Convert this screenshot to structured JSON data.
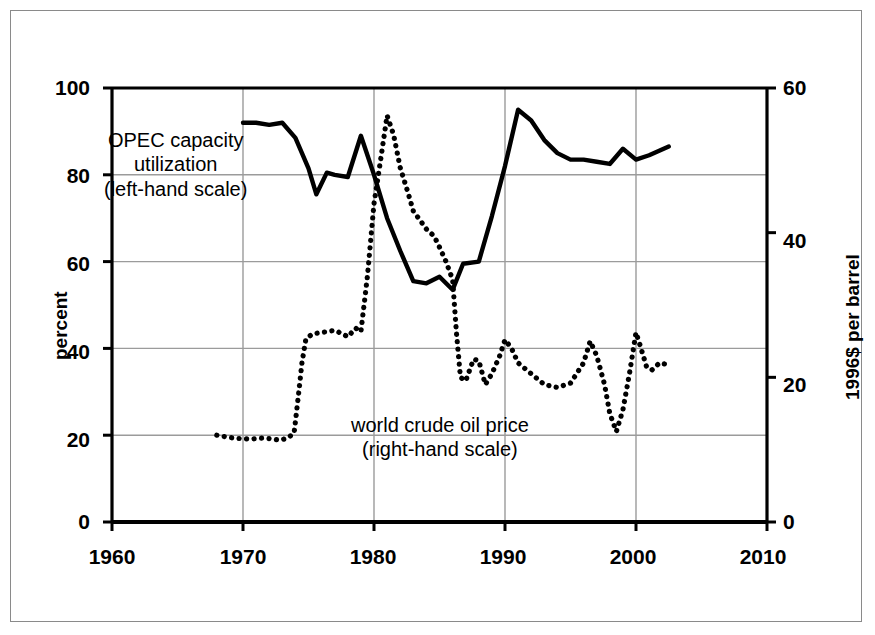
{
  "chart_data": {
    "type": "line",
    "title": "",
    "xlabel": "",
    "xlim": [
      1960,
      2010
    ],
    "xticks": [
      1960,
      1970,
      1980,
      1990,
      2000,
      2010
    ],
    "grid": true,
    "legend_position": "inline-annotations",
    "axes": {
      "left": {
        "label": "percent",
        "ticks": [
          0,
          20,
          40,
          60,
          80,
          100
        ],
        "lim": [
          0,
          100
        ]
      },
      "right": {
        "label": "1996$ per barrel",
        "ticks": [
          0,
          20,
          40,
          60
        ],
        "lim": [
          0,
          60
        ]
      }
    },
    "annotations": [
      {
        "name": "opec-capacity-label",
        "lines": [
          "OPEC capacity",
          "utilization",
          "(left-hand scale)"
        ],
        "series": "OPEC capacity utilization"
      },
      {
        "name": "oil-price-label",
        "lines": [
          "world crude oil price",
          "(right-hand scale)"
        ],
        "series": "world crude oil price"
      }
    ],
    "series": [
      {
        "name": "OPEC capacity utilization",
        "axis": "left",
        "style": "solid",
        "color": "#000000",
        "unit": "percent",
        "points": [
          [
            1970.0,
            92.0
          ],
          [
            1971.0,
            92.0
          ],
          [
            1972.0,
            91.5
          ],
          [
            1973.0,
            92.0
          ],
          [
            1974.0,
            88.5
          ],
          [
            1975.0,
            81.5
          ],
          [
            1975.6,
            75.5
          ],
          [
            1976.4,
            80.5
          ],
          [
            1977.0,
            80.0
          ],
          [
            1978.0,
            79.5
          ],
          [
            1979.0,
            89.0
          ],
          [
            1980.0,
            80.0
          ],
          [
            1981.0,
            70.0
          ],
          [
            1982.0,
            62.5
          ],
          [
            1983.0,
            55.5
          ],
          [
            1984.0,
            55.0
          ],
          [
            1985.0,
            56.5
          ],
          [
            1986.0,
            53.5
          ],
          [
            1986.8,
            59.5
          ],
          [
            1988.0,
            60.0
          ],
          [
            1989.0,
            70.5
          ],
          [
            1990.0,
            82.0
          ],
          [
            1991.0,
            95.0
          ],
          [
            1992.0,
            92.5
          ],
          [
            1993.0,
            88.0
          ],
          [
            1994.0,
            85.0
          ],
          [
            1995.0,
            83.5
          ],
          [
            1996.0,
            83.5
          ],
          [
            1997.0,
            83.0
          ],
          [
            1998.0,
            82.5
          ],
          [
            1999.0,
            86.0
          ],
          [
            2000.0,
            83.5
          ],
          [
            2001.0,
            84.5
          ],
          [
            2002.5,
            86.5
          ]
        ]
      },
      {
        "name": "world crude oil price",
        "axis": "right",
        "style": "dotted",
        "color": "#000000",
        "unit": "1996$ per barrel",
        "points": [
          [
            1968.0,
            12.0
          ],
          [
            1968.6,
            11.8
          ],
          [
            1969.3,
            11.6
          ],
          [
            1970.0,
            11.5
          ],
          [
            1970.8,
            11.5
          ],
          [
            1971.5,
            11.6
          ],
          [
            1972.2,
            11.5
          ],
          [
            1972.8,
            11.3
          ],
          [
            1973.4,
            11.6
          ],
          [
            1973.9,
            12.3
          ],
          [
            1974.2,
            17.0
          ],
          [
            1974.5,
            22.0
          ],
          [
            1974.8,
            25.3
          ],
          [
            1975.3,
            26.0
          ],
          [
            1976.0,
            26.2
          ],
          [
            1977.0,
            26.5
          ],
          [
            1977.6,
            26.0
          ],
          [
            1978.0,
            25.6
          ],
          [
            1978.6,
            26.8
          ],
          [
            1979.0,
            26.3
          ],
          [
            1979.5,
            34.0
          ],
          [
            1980.0,
            44.0
          ],
          [
            1980.5,
            50.0
          ],
          [
            1981.0,
            56.2
          ],
          [
            1981.5,
            53.5
          ],
          [
            1982.0,
            49.0
          ],
          [
            1982.6,
            45.5
          ],
          [
            1983.0,
            43.0
          ],
          [
            1983.6,
            41.5
          ],
          [
            1984.0,
            40.5
          ],
          [
            1984.6,
            39.5
          ],
          [
            1985.0,
            38.0
          ],
          [
            1985.5,
            36.0
          ],
          [
            1986.0,
            33.5
          ],
          [
            1986.3,
            26.0
          ],
          [
            1986.6,
            20.0
          ],
          [
            1987.0,
            19.5
          ],
          [
            1987.6,
            22.5
          ],
          [
            1988.0,
            22.3
          ],
          [
            1988.5,
            19.0
          ],
          [
            1989.0,
            20.5
          ],
          [
            1989.6,
            23.0
          ],
          [
            1990.0,
            25.2
          ],
          [
            1990.5,
            24.0
          ],
          [
            1991.0,
            22.0
          ],
          [
            1992.0,
            20.5
          ],
          [
            1993.0,
            19.0
          ],
          [
            1994.0,
            18.6
          ],
          [
            1995.0,
            19.2
          ],
          [
            1996.0,
            22.0
          ],
          [
            1996.5,
            25.0
          ],
          [
            1997.0,
            23.0
          ],
          [
            1997.6,
            19.0
          ],
          [
            1998.0,
            15.0
          ],
          [
            1998.5,
            12.5
          ],
          [
            1999.0,
            15.5
          ],
          [
            1999.5,
            20.5
          ],
          [
            2000.0,
            26.2
          ],
          [
            2000.3,
            24.5
          ],
          [
            2000.8,
            21.5
          ],
          [
            2001.2,
            21.0
          ],
          [
            2001.8,
            22.0
          ],
          [
            2002.3,
            21.8
          ]
        ]
      }
    ]
  },
  "axis_text": {
    "left_ticks": [
      "100",
      "80",
      "60",
      "40",
      "20",
      "0"
    ],
    "right_ticks": [
      "60",
      "40",
      "20",
      "0"
    ],
    "x_ticks": [
      "1960",
      "1970",
      "1980",
      "1990",
      "2000",
      "2010"
    ],
    "left_title": "percent",
    "right_title": "1996$ per barrel"
  },
  "labels": {
    "opec_line1": "OPEC capacity",
    "opec_line2": "utilization",
    "opec_line3": "(left-hand scale)",
    "oil_line1": "world crude oil price",
    "oil_line2": "(right-hand scale)"
  },
  "colors": {
    "ink": "#000000",
    "grid": "#9b9b9b",
    "frame": "#8a8a8a",
    "background": "#ffffff"
  }
}
